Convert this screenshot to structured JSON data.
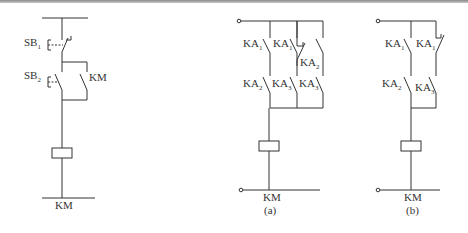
{
  "figure": {
    "left_circuit": {
      "labels": {
        "sb1": "SB",
        "sb1_sub": "1",
        "sb2": "SB",
        "sb2_sub": "2",
        "km_contact": "KM",
        "coil": "KM"
      }
    },
    "circuit_a": {
      "caption": "(a)",
      "labels": {
        "r1c1": "KA",
        "r1c1_sub": "1",
        "r1c2": "KA",
        "r1c2_sub": "1",
        "r1c3": "KA",
        "r1c3_sub": "2",
        "r2c1": "KA",
        "r2c1_sub": "2",
        "r2c2": "KA",
        "r2c2_sub": "3",
        "r2c3": "KA",
        "r2c3_sub": "3",
        "coil": "KM"
      }
    },
    "circuit_b": {
      "caption": "(b)",
      "labels": {
        "r1c1": "KA",
        "r1c1_sub": "1",
        "r1c2": "KA",
        "r1c2_sub": "1",
        "r2c1": "KA",
        "r2c1_sub": "2",
        "r2c2": "KA",
        "r2c2_sub": "3",
        "coil": "KM"
      }
    }
  }
}
